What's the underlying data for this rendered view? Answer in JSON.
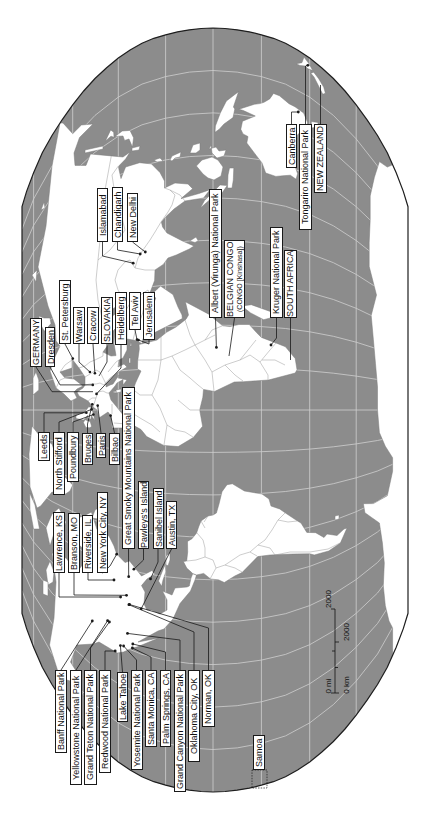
{
  "colors": {
    "ocean": "#8c8c8c",
    "land": "#ffffff",
    "graticule": "#cfcfcf",
    "border": "#9a9a9a",
    "outline": "#1e1e1e",
    "leader": "#1a1a1a"
  },
  "labels": {
    "north_america_west": [
      "Banff National Park",
      "Yellowstone National Park",
      "Grand Teton National Park",
      "Redwood National Park",
      "Lake Tahoe",
      "Yosemite National Park",
      "Santa Monica, CA",
      "Palm Springs, CA",
      "Grand Canyon National Park",
      "Oklahoma City, OK",
      "Norman, OK"
    ],
    "north_america_central": [
      "Lawrence, KS",
      "Branson, MO",
      "Riverside, IL",
      "New York City, NY"
    ],
    "north_america_east": [
      "Great Smoky Mountains National Park",
      "Pawleys's Island",
      "Sanibel Island",
      "Austin, TX"
    ],
    "western_europe": [
      "Leeds",
      "North Stifford",
      "Poundbury",
      "Bruges",
      "Paris",
      "Bilbao"
    ],
    "central_europe_middle_east": [
      "GERMANY",
      "Dresden",
      "St. Petersburg",
      "Warsaw",
      "Cracow",
      "SLOVAKIA",
      "Heidelberg",
      "Tel Aviv",
      "Jerusalem"
    ],
    "south_asia": [
      "Islamabad",
      "Chandigarh",
      "New Delhi"
    ],
    "africa": [
      "Albert (Virunga) National Park",
      {
        "line1": "BELGIAN CONGO",
        "line2": "(CONGO [Kinshasa])"
      },
      "Kruger National Park",
      "SOUTH AFRICA"
    ],
    "oceania": [
      "Canberra",
      "Tongariro National Park",
      "NEW ZEALAND",
      "Samoa"
    ]
  },
  "scale_bar": {
    "mi_zero": "0 mi",
    "mi_max": "2000",
    "km_zero": "0 km",
    "km_max": "2000"
  }
}
